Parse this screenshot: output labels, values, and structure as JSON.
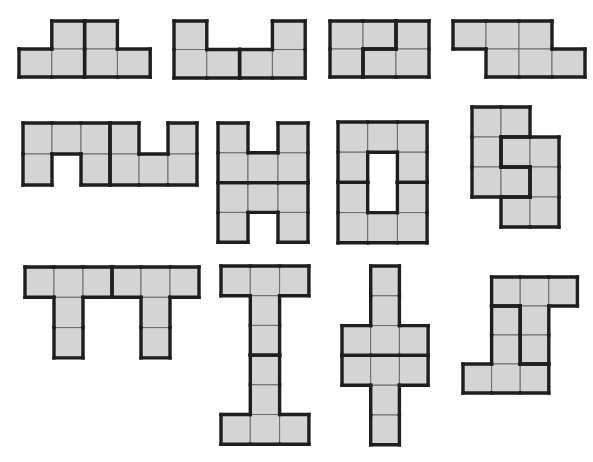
{
  "colors": {
    "cell_fill": "#d4d4d4",
    "thin_line": "#6a6a6a",
    "thick_line": "#1e1e1e",
    "background": "#ffffff"
  },
  "figures": [
    {
      "id": "figure-1",
      "x": 19,
      "y": 21,
      "cw": 32.8,
      "ch": 28,
      "cells": [
        [
          0,
          1,
          "A"
        ],
        [
          0,
          2,
          "B"
        ],
        [
          1,
          0,
          "A"
        ],
        [
          1,
          1,
          "A"
        ],
        [
          1,
          2,
          "B"
        ],
        [
          1,
          3,
          "B"
        ]
      ]
    },
    {
      "id": "figure-2",
      "x": 174,
      "y": 21,
      "cw": 32.8,
      "ch": 28.5,
      "cells": [
        [
          0,
          0,
          "A"
        ],
        [
          0,
          3,
          "B"
        ],
        [
          1,
          0,
          "A"
        ],
        [
          1,
          1,
          "A"
        ],
        [
          1,
          2,
          "B"
        ],
        [
          1,
          3,
          "B"
        ]
      ]
    },
    {
      "id": "figure-3",
      "x": 330,
      "y": 21,
      "cw": 33,
      "ch": 28,
      "cells": [
        [
          0,
          0,
          "A"
        ],
        [
          0,
          1,
          "A"
        ],
        [
          0,
          2,
          "B"
        ],
        [
          1,
          0,
          "A"
        ],
        [
          1,
          1,
          "B"
        ],
        [
          1,
          2,
          "B"
        ]
      ]
    },
    {
      "id": "figure-4",
      "x": 453,
      "y": 21,
      "cw": 33,
      "ch": 28,
      "cells": [
        [
          0,
          0,
          "A"
        ],
        [
          0,
          1,
          "A"
        ],
        [
          0,
          2,
          "A"
        ],
        [
          1,
          1,
          "A"
        ],
        [
          1,
          2,
          "A"
        ],
        [
          1,
          3,
          "A"
        ]
      ]
    },
    {
      "id": "figure-5",
      "x": 23,
      "y": 123,
      "cw": 29,
      "ch": 31,
      "cells": [
        [
          0,
          0,
          "A"
        ],
        [
          0,
          1,
          "A"
        ],
        [
          0,
          2,
          "A"
        ],
        [
          0,
          3,
          "B"
        ],
        [
          0,
          5,
          "B"
        ],
        [
          1,
          0,
          "A"
        ],
        [
          1,
          2,
          "A"
        ],
        [
          1,
          3,
          "B"
        ],
        [
          1,
          4,
          "B"
        ],
        [
          1,
          5,
          "B"
        ]
      ]
    },
    {
      "id": "figure-6",
      "x": 218,
      "y": 123,
      "cw": 30,
      "ch": 29.8,
      "cells": [
        [
          0,
          0,
          "A"
        ],
        [
          0,
          2,
          "A"
        ],
        [
          1,
          0,
          "A"
        ],
        [
          1,
          1,
          "A"
        ],
        [
          1,
          2,
          "A"
        ],
        [
          2,
          0,
          "B"
        ],
        [
          2,
          1,
          "B"
        ],
        [
          2,
          2,
          "B"
        ],
        [
          3,
          0,
          "B"
        ],
        [
          3,
          2,
          "B"
        ]
      ]
    },
    {
      "id": "figure-7",
      "x": 338,
      "y": 122,
      "cw": 29.7,
      "ch": 30.2,
      "cells": [
        [
          0,
          0,
          "A"
        ],
        [
          0,
          1,
          "A"
        ],
        [
          0,
          2,
          "A"
        ],
        [
          1,
          0,
          "A"
        ],
        [
          1,
          2,
          "A"
        ],
        [
          2,
          0,
          "B"
        ],
        [
          2,
          2,
          "B"
        ],
        [
          3,
          0,
          "B"
        ],
        [
          3,
          1,
          "B"
        ],
        [
          3,
          2,
          "B"
        ]
      ]
    },
    {
      "id": "figure-8",
      "x": 472,
      "y": 107,
      "cw": 29,
      "ch": 30,
      "cells": [
        [
          0,
          0,
          "A"
        ],
        [
          0,
          1,
          "A"
        ],
        [
          1,
          0,
          "A"
        ],
        [
          1,
          1,
          "B"
        ],
        [
          1,
          2,
          "B"
        ],
        [
          2,
          0,
          "A"
        ],
        [
          2,
          1,
          "A"
        ],
        [
          2,
          2,
          "B"
        ],
        [
          3,
          1,
          "B"
        ],
        [
          3,
          2,
          "B"
        ]
      ]
    },
    {
      "id": "figure-9",
      "x": 25,
      "y": 267,
      "cw": 29,
      "ch": 30.3,
      "cells": [
        [
          0,
          0,
          "A"
        ],
        [
          0,
          1,
          "A"
        ],
        [
          0,
          2,
          "A"
        ],
        [
          0,
          3,
          "B"
        ],
        [
          0,
          4,
          "B"
        ],
        [
          0,
          5,
          "B"
        ],
        [
          1,
          1,
          "A"
        ],
        [
          2,
          1,
          "A"
        ],
        [
          1,
          4,
          "B"
        ],
        [
          2,
          4,
          "B"
        ]
      ]
    },
    {
      "id": "figure-10",
      "x": 221,
      "y": 266,
      "cw": 29.3,
      "ch": 29.7,
      "cells": [
        [
          0,
          0,
          "A"
        ],
        [
          0,
          1,
          "A"
        ],
        [
          0,
          2,
          "A"
        ],
        [
          1,
          1,
          "A"
        ],
        [
          2,
          1,
          "A"
        ],
        [
          3,
          1,
          "B"
        ],
        [
          4,
          1,
          "B"
        ],
        [
          5,
          0,
          "B"
        ],
        [
          5,
          1,
          "B"
        ],
        [
          5,
          2,
          "B"
        ]
      ]
    },
    {
      "id": "figure-11",
      "x": 342,
      "y": 266,
      "cw": 28.7,
      "ch": 29.8,
      "cells": [
        [
          0,
          1,
          "A"
        ],
        [
          1,
          1,
          "A"
        ],
        [
          2,
          0,
          "A"
        ],
        [
          2,
          1,
          "A"
        ],
        [
          2,
          2,
          "A"
        ],
        [
          3,
          0,
          "B"
        ],
        [
          3,
          1,
          "B"
        ],
        [
          3,
          2,
          "B"
        ],
        [
          4,
          1,
          "B"
        ],
        [
          5,
          1,
          "B"
        ]
      ]
    },
    {
      "id": "figure-12",
      "x": 463,
      "y": 277,
      "cw": 28.6,
      "ch": 29,
      "cells": [
        [
          0,
          1,
          "A"
        ],
        [
          0,
          2,
          "A"
        ],
        [
          0,
          3,
          "A"
        ],
        [
          1,
          1,
          "B"
        ],
        [
          1,
          2,
          "A"
        ],
        [
          2,
          1,
          "B"
        ],
        [
          2,
          2,
          "A"
        ],
        [
          3,
          0,
          "B"
        ],
        [
          3,
          1,
          "B"
        ],
        [
          3,
          2,
          "B"
        ]
      ]
    }
  ]
}
